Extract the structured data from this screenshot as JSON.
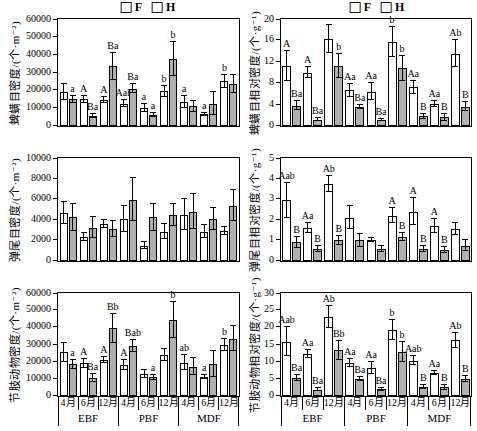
{
  "figure": {
    "legend": {
      "f_label": "F",
      "h_label": "H"
    },
    "colors": {
      "f_fill": "#ffffff",
      "h_fill": "#b0b0b0",
      "axis": "#000000"
    }
  },
  "axis": {
    "months": [
      "4月",
      "6月",
      "12月"
    ],
    "groups": [
      "EBF",
      "PBF",
      "MDF"
    ]
  },
  "chart_data": [
    {
      "id": "mite-density",
      "type": "bar",
      "ylabel": "蜱螨目密度/(个·m⁻²)",
      "ylim": [
        0,
        60000
      ],
      "yticks": [
        0,
        10000,
        20000,
        30000,
        40000,
        50000,
        60000
      ],
      "categories": [
        "EBF-4月",
        "EBF-6月",
        "EBF-12月",
        "PBF-4月",
        "PBF-6月",
        "PBF-12月",
        "MDF-4月",
        "MDF-6月",
        "MDF-12月"
      ],
      "series": [
        {
          "name": "F",
          "values": [
            19000,
            15000,
            14500,
            12500,
            10000,
            19500,
            13500,
            6500,
            25000
          ],
          "errors": [
            4500,
            2000,
            1500,
            2000,
            2200,
            3000,
            3500,
            800,
            3500
          ],
          "sig_labels": [
            "",
            "A",
            "A",
            "Aab",
            "a",
            "b",
            "a",
            "a",
            "b"
          ]
        },
        {
          "name": "H",
          "values": [
            15000,
            5500,
            33500,
            21000,
            6000,
            37500,
            11000,
            12500,
            23500
          ],
          "errors": [
            2000,
            1000,
            7500,
            2500,
            1200,
            9500,
            3200,
            6500,
            5000
          ],
          "sig_labels": [
            "a",
            "Ba",
            "Ba",
            "Ba",
            "a",
            "b",
            "",
            "",
            ""
          ]
        }
      ]
    },
    {
      "id": "mite-relative-density",
      "type": "bar",
      "ylabel": "蜱螨目相对密度/(个·g⁻¹)",
      "ylim": [
        0,
        20
      ],
      "yticks": [
        0,
        4,
        8,
        12,
        16,
        20
      ],
      "categories": [
        "EBF-4月",
        "EBF-6月",
        "EBF-12月",
        "PBF-4月",
        "PBF-6月",
        "PBF-12月",
        "MDF-4月",
        "MDF-6月",
        "MDF-12月"
      ],
      "series": [
        {
          "name": "F",
          "values": [
            11.3,
            10.0,
            16.2,
            6.7,
            6.4,
            15.7,
            7.2,
            4.1,
            13.5
          ],
          "errors": [
            2.8,
            1.0,
            2.6,
            1.2,
            1.6,
            2.8,
            1.2,
            0.6,
            2.5
          ],
          "sig_labels": [
            "A",
            "A",
            "",
            "Aa",
            "Aa",
            "b",
            "Aa",
            "Aa",
            "Ab"
          ]
        },
        {
          "name": "H",
          "values": [
            3.8,
            1.2,
            11.2,
            3.6,
            1.1,
            10.8,
            1.8,
            1.6,
            3.6
          ],
          "errors": [
            0.8,
            0.3,
            2.2,
            0.4,
            0.2,
            2.3,
            0.5,
            0.6,
            0.8
          ],
          "sig_labels": [
            "Ba",
            "Ba",
            "b",
            "Ba",
            "Ba",
            "b",
            "B",
            "B",
            "B"
          ]
        }
      ]
    },
    {
      "id": "springtail-density",
      "type": "bar",
      "ylabel": "弹尾目密度/(个·m⁻²)",
      "ylim": [
        0,
        10000
      ],
      "yticks": [
        0,
        2000,
        4000,
        6000,
        8000,
        10000
      ],
      "categories": [
        "EBF-4月",
        "EBF-6月",
        "EBF-12月",
        "PBF-4月",
        "PBF-6月",
        "PBF-12月",
        "MDF-4月",
        "MDF-6月",
        "MDF-12月"
      ],
      "series": [
        {
          "name": "F",
          "values": [
            4650,
            2350,
            3600,
            4100,
            1500,
            2850,
            4500,
            2850,
            2950
          ],
          "errors": [
            1100,
            400,
            350,
            1250,
            300,
            700,
            1500,
            650,
            400
          ],
          "sig_labels": [
            "",
            "",
            "",
            "",
            "",
            "",
            "",
            "",
            ""
          ]
        },
        {
          "name": "H",
          "values": [
            4250,
            3250,
            3100,
            5950,
            4250,
            4450,
            4800,
            4100,
            5350
          ],
          "errors": [
            1300,
            1000,
            800,
            2100,
            1300,
            1050,
            1700,
            1050,
            1500
          ],
          "sig_labels": [
            "",
            "",
            "",
            "",
            "",
            "",
            "",
            "",
            ""
          ]
        }
      ]
    },
    {
      "id": "springtail-relative-density",
      "type": "bar",
      "ylabel": "弹尾目相对密度/(个·g⁻¹)",
      "ylim": [
        0,
        5
      ],
      "yticks": [
        0,
        1,
        2,
        3,
        4,
        5
      ],
      "categories": [
        "EBF-4月",
        "EBF-6月",
        "EBF-12月",
        "PBF-4月",
        "PBF-6月",
        "PBF-12月",
        "MDF-4月",
        "MDF-6月",
        "MDF-12月"
      ],
      "series": [
        {
          "name": "F",
          "values": [
            2.95,
            1.6,
            3.75,
            2.1,
            1.0,
            2.2,
            2.4,
            1.7,
            1.55
          ],
          "errors": [
            0.85,
            0.25,
            0.4,
            0.55,
            0.1,
            0.35,
            0.65,
            0.35,
            0.3
          ],
          "sig_labels": [
            "Aab",
            "Aa",
            "Ab",
            "",
            "",
            "A",
            "A",
            "A",
            ""
          ]
        },
        {
          "name": "H",
          "values": [
            0.9,
            0.6,
            1.0,
            1.0,
            0.6,
            1.15,
            0.6,
            0.55,
            0.75
          ],
          "errors": [
            0.25,
            0.15,
            0.2,
            0.3,
            0.15,
            0.2,
            0.15,
            0.15,
            0.25
          ],
          "sig_labels": [
            "B",
            "B",
            "B",
            "",
            "",
            "B",
            "B",
            "B",
            ""
          ]
        }
      ]
    },
    {
      "id": "arthropod-density",
      "type": "bar",
      "ylabel": "节肢动物密度/(个·m⁻²)",
      "ylim": [
        0,
        60000
      ],
      "yticks": [
        0,
        10000,
        20000,
        30000,
        40000,
        50000,
        60000
      ],
      "categories": [
        "EBF-4月",
        "EBF-6月",
        "EBF-12月",
        "PBF-4月",
        "PBF-6月",
        "PBF-12月",
        "MDF-4月",
        "MDF-6月",
        "MDF-12月"
      ],
      "series": [
        {
          "name": "F",
          "values": [
            25500,
            19000,
            21000,
            18000,
            12800,
            24000,
            19500,
            11000,
            29500
          ],
          "errors": [
            5500,
            2500,
            1500,
            3000,
            2500,
            3500,
            4500,
            1000,
            3500
          ],
          "sig_labels": [
            "",
            "A",
            "A",
            "A",
            "",
            "",
            "ab",
            "a",
            "b"
          ]
        },
        {
          "name": "H",
          "values": [
            18500,
            10500,
            39500,
            29000,
            11000,
            44500,
            17000,
            18500,
            33500
          ],
          "errors": [
            2500,
            2500,
            8500,
            3500,
            1500,
            10500,
            5000,
            7500,
            7000
          ],
          "sig_labels": [
            "a",
            "Ba",
            "Bb",
            "Bab",
            "a",
            "b",
            "",
            "",
            ""
          ]
        }
      ]
    },
    {
      "id": "arthropod-relative-density",
      "type": "bar",
      "ylabel": "节肢动物相对密度/(个·g⁻¹)",
      "ylim": [
        0,
        30
      ],
      "yticks": [
        0,
        5,
        10,
        15,
        20,
        25,
        30
      ],
      "categories": [
        "EBF-4月",
        "EBF-6月",
        "EBF-12月",
        "PBF-4月",
        "PBF-6月",
        "PBF-12月",
        "MDF-4月",
        "MDF-6月",
        "MDF-12月"
      ],
      "series": [
        {
          "name": "F",
          "values": [
            15.8,
            12.3,
            23.0,
            9.7,
            8.2,
            19.2,
            10.3,
            6.8,
            16.2
          ],
          "errors": [
            4.2,
            1.2,
            3.3,
            1.2,
            1.7,
            3.0,
            1.4,
            0.6,
            2.2
          ],
          "sig_labels": [
            "Aab",
            "Aa",
            "Ab",
            "Aa",
            "Aa",
            "b",
            "Aab",
            "Aa",
            "Ab"
          ]
        },
        {
          "name": "H",
          "values": [
            5.2,
            1.8,
            13.3,
            5.0,
            1.9,
            12.8,
            2.6,
            2.5,
            4.9
          ],
          "errors": [
            0.8,
            0.4,
            2.8,
            0.6,
            0.5,
            2.8,
            0.6,
            0.8,
            0.9
          ],
          "sig_labels": [
            "Ba",
            "Ba",
            "Bb",
            "Ba",
            "Ba",
            "b",
            "B",
            "B",
            "B"
          ]
        }
      ]
    }
  ]
}
